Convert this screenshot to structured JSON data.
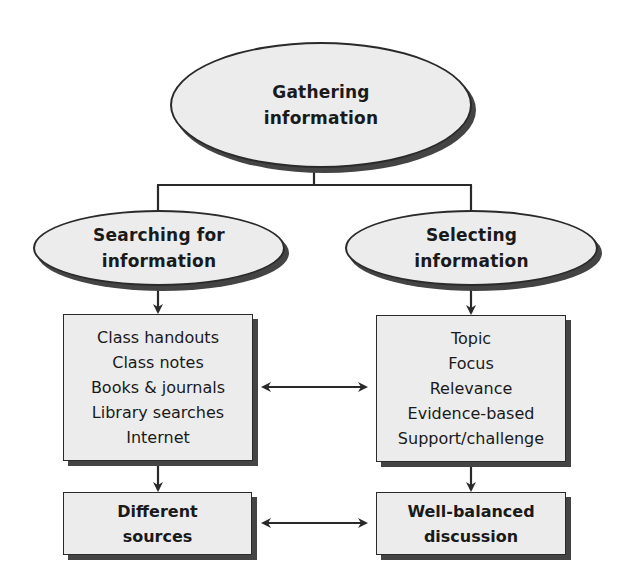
{
  "diagram": {
    "top_node": {
      "lines": [
        "Gathering",
        "information"
      ]
    },
    "branches": [
      {
        "node": {
          "lines": [
            "Searching for",
            "information"
          ]
        },
        "list_box": {
          "items": [
            "Class handouts",
            "Class notes",
            "Books & journals",
            "Library searches",
            "Internet"
          ]
        },
        "outcome_box": {
          "lines": [
            "Different",
            "sources"
          ]
        }
      },
      {
        "node": {
          "lines": [
            "Selecting",
            "information"
          ]
        },
        "list_box": {
          "items": [
            "Topic",
            "Focus",
            "Relevance",
            "Evidence-based",
            "Support/challenge"
          ]
        },
        "outcome_box": {
          "lines": [
            "Well-balanced",
            "discussion"
          ]
        }
      }
    ],
    "connectors": {
      "tree": "top node splits to both branch nodes",
      "arrows_down": [
        "search-node -> sources-list",
        "select-node -> criteria-list",
        "sources-list -> different-sources",
        "criteria-list -> well-balanced"
      ],
      "bidirectional": [
        "sources-list <-> criteria-list",
        "different-sources <-> well-balanced"
      ]
    },
    "colors": {
      "fill": "#ececec",
      "stroke": "#2a2a2a",
      "shadow": "#444444",
      "background": "#ffffff"
    }
  }
}
